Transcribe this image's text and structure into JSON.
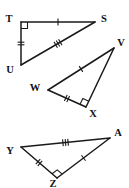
{
  "figure": {
    "type": "geometry-diagram",
    "background_color": "#ffffff",
    "stroke_color": "#1a1a1a",
    "label_color": "#111111",
    "triangles": [
      {
        "id": "triangle-tsu",
        "name": "Triangle TSU",
        "vertices": [
          {
            "label": "T",
            "x": 21,
            "y": 22,
            "label_x": 9,
            "label_y": 20
          },
          {
            "label": "S",
            "x": 95,
            "y": 22,
            "label_x": 104,
            "label_y": 20
          },
          {
            "label": "U",
            "x": 21,
            "y": 65,
            "label_x": 10,
            "label_y": 71
          }
        ],
        "sides": [
          {
            "name": "TS",
            "from": "T",
            "to": "S",
            "ticks": 1
          },
          {
            "name": "TU",
            "from": "T",
            "to": "U",
            "ticks": 2
          },
          {
            "name": "US",
            "from": "U",
            "to": "S",
            "ticks": 3
          }
        ],
        "right_angle_at": "T"
      },
      {
        "id": "triangle-wvx",
        "name": "Triangle WVX",
        "vertices": [
          {
            "label": "W",
            "x": 48,
            "y": 90,
            "label_x": 35,
            "label_y": 89
          },
          {
            "label": "V",
            "x": 114,
            "y": 48,
            "label_x": 121,
            "label_y": 44
          },
          {
            "label": "X",
            "x": 86,
            "y": 107,
            "label_x": 93,
            "label_y": 115
          }
        ],
        "sides": [
          {
            "name": "WV",
            "from": "W",
            "to": "V",
            "ticks": 1
          },
          {
            "name": "WX",
            "from": "W",
            "to": "X",
            "ticks": 2
          },
          {
            "name": "VX",
            "from": "V",
            "to": "X",
            "ticks": 0
          }
        ],
        "right_angle_at": "X"
      },
      {
        "id": "triangle-yza",
        "name": "Triangle YZA",
        "vertices": [
          {
            "label": "Y",
            "x": 21,
            "y": 147,
            "label_x": 10,
            "label_y": 152
          },
          {
            "label": "A",
            "x": 110,
            "y": 138,
            "label_x": 118,
            "label_y": 134
          },
          {
            "label": "Z",
            "x": 57,
            "y": 178,
            "label_x": 53,
            "label_y": 185
          }
        ],
        "sides": [
          {
            "name": "YA",
            "from": "Y",
            "to": "A",
            "ticks": 3
          },
          {
            "name": "YZ",
            "from": "Y",
            "to": "Z",
            "ticks": 2
          },
          {
            "name": "ZA",
            "from": "Z",
            "to": "A",
            "ticks": 1
          }
        ],
        "right_angle_at": "Z"
      }
    ]
  }
}
